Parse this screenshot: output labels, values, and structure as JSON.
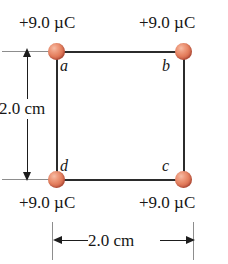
{
  "figure": {
    "type": "physics-diagram",
    "background_color": "#ffffff",
    "line_color": "#2b2b2b",
    "charge_color": "#e4805f"
  },
  "charges": [
    {
      "id": "a",
      "corner": "top-left",
      "letter": "a",
      "value": "+9.0 µC"
    },
    {
      "id": "b",
      "corner": "top-right",
      "letter": "b",
      "value": "+9.0 µC"
    },
    {
      "id": "c",
      "corner": "bottom-right",
      "letter": "c",
      "value": "+9.0 µC"
    },
    {
      "id": "d",
      "corner": "bottom-left",
      "letter": "d",
      "value": "+9.0 µC"
    }
  ],
  "dimensions": {
    "vertical": {
      "label": "2.0 cm",
      "orientation": "vertical",
      "position": "left"
    },
    "horizontal": {
      "label": "2.0 cm",
      "orientation": "horizontal",
      "position": "bottom"
    }
  }
}
